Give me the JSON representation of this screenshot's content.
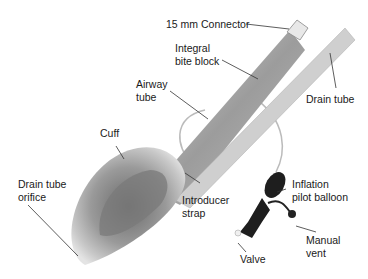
{
  "figure": {
    "labels": {
      "connector": "15 mm Connector",
      "bite_block_1": "Integral",
      "bite_block_2": "bite block",
      "airway_tube_1": "Airway",
      "airway_tube_2": "tube",
      "drain_tube": "Drain tube",
      "cuff": "Cuff",
      "drain_orifice_1": "Drain tube",
      "drain_orifice_2": "orifice",
      "introducer_1": "Introducer",
      "introducer_2": "strap",
      "pilot_1": "Inflation",
      "pilot_2": "pilot balloon",
      "manual_vent_1": "Manual",
      "manual_vent_2": "vent",
      "valve": "Valve"
    }
  }
}
